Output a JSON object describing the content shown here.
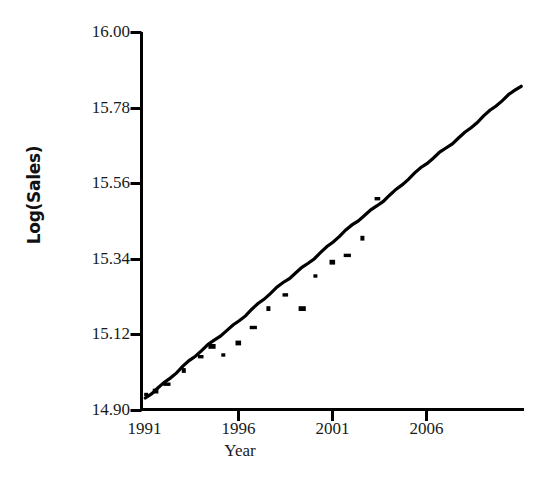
{
  "chart_data": {
    "type": "scatter",
    "title": "",
    "xlabel": "Year",
    "ylabel": "Log(Sales)",
    "xlim": [
      1990.85,
      2011.2
    ],
    "ylim": [
      14.9,
      16.0
    ],
    "xticks": [
      1991,
      1996,
      2001,
      2006
    ],
    "xtick_labels": [
      "1991",
      "1996",
      "2001",
      "2006"
    ],
    "yticks": [
      14.9,
      15.12,
      15.34,
      15.56,
      15.78,
      16.0
    ],
    "ytick_labels": [
      "14.90",
      "15.12",
      "15.34",
      "15.56",
      "15.78",
      "16.00"
    ],
    "grid": false,
    "legend": null,
    "marker": "square",
    "marker_color": "#000000",
    "line_color": "#000000",
    "axis_color": "#000000",
    "background": "#ffffff",
    "series": [
      {
        "name": "observed",
        "type": "scatter",
        "x": [
          1991.1,
          1991.6,
          1992.2,
          1993.1,
          1994.0,
          1994.6,
          1995.2,
          1996.0,
          1996.8,
          1997.6,
          1998.5,
          1999.4,
          2000.1,
          2001.0,
          2001.8,
          2002.6,
          2003.4
        ],
        "y": [
          14.945,
          14.955,
          14.975,
          15.015,
          15.055,
          15.085,
          15.06,
          15.095,
          15.14,
          15.195,
          15.235,
          15.195,
          15.29,
          15.33,
          15.35,
          15.4,
          15.515
        ]
      },
      {
        "name": "fitted trend",
        "type": "line",
        "x": [
          1991.05,
          2011.05
        ],
        "y": [
          14.935,
          15.845
        ]
      }
    ]
  },
  "axes": {
    "ylabel_text": "Log(Sales)",
    "xlabel_text": "Year"
  }
}
